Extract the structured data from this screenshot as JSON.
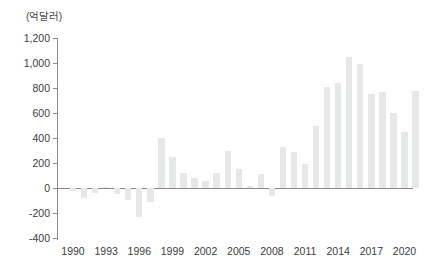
{
  "chart_data": {
    "type": "bar",
    "title": "",
    "subtitle": "",
    "xlabel": "",
    "ylabel": "",
    "unit_label": "(억달러)",
    "grid": false,
    "legend": null,
    "ylim": [
      -400,
      1200
    ],
    "ytick_values": [
      1200,
      1000,
      800,
      600,
      400,
      200,
      0,
      -200,
      -400
    ],
    "ytick_labels": [
      "1,200",
      "1,000",
      "800",
      "600",
      "400",
      "200",
      "0",
      "-200",
      "-400"
    ],
    "xtick_labels": [
      "1990",
      "1993",
      "1996",
      "1999",
      "2002",
      "2005",
      "2008",
      "2011",
      "2014",
      "2017",
      "2020"
    ],
    "xtick_years": [
      1990,
      1993,
      1996,
      1999,
      2002,
      2005,
      2008,
      2011,
      2014,
      2017,
      2020
    ],
    "bar_color": "#e6e7e8",
    "axis_color": "#8a8a8a",
    "categories": [
      "1990",
      "1991",
      "1992",
      "1993",
      "1994",
      "1995",
      "1996",
      "1997",
      "1998",
      "1999",
      "2000",
      "2001",
      "2002",
      "2003",
      "2004",
      "2005",
      "2006",
      "2007",
      "2008",
      "2009",
      "2010",
      "2011",
      "2012",
      "2013",
      "2014",
      "2015",
      "2016",
      "2017",
      "2018",
      "2019",
      "2020",
      "2021"
    ],
    "values": [
      -22,
      -83,
      -40,
      10,
      -45,
      -97,
      -230,
      -110,
      400,
      245,
      120,
      80,
      55,
      120,
      300,
      150,
      20,
      110,
      -60,
      330,
      290,
      190,
      500,
      810,
      840,
      1050,
      990,
      750,
      770,
      600,
      450,
      780
    ]
  }
}
